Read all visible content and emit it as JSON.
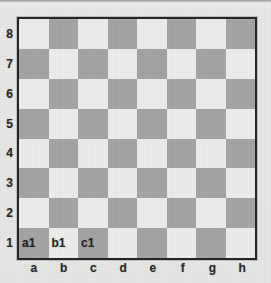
{
  "diagram": {
    "kind": "chessboard-coordinates",
    "orientation": "white-bottom"
  },
  "colors": {
    "light_square": "#ededeb",
    "dark_square": "#a3a3a3",
    "border": "#262626",
    "paper": "#e9e9e7",
    "text": "#2b2b2b"
  },
  "ranks": [
    "8",
    "7",
    "6",
    "5",
    "4",
    "3",
    "2",
    "1"
  ],
  "files": [
    "a",
    "b",
    "c",
    "d",
    "e",
    "f",
    "g",
    "h"
  ],
  "square_labels": {
    "a1": "a1",
    "b1": "b1",
    "c1": "c1"
  },
  "board": {
    "rows": [
      {
        "rank": "8",
        "squares": [
          {
            "id": "a8",
            "shade": "light",
            "label": ""
          },
          {
            "id": "b8",
            "shade": "dark",
            "label": ""
          },
          {
            "id": "c8",
            "shade": "light",
            "label": ""
          },
          {
            "id": "d8",
            "shade": "dark",
            "label": ""
          },
          {
            "id": "e8",
            "shade": "light",
            "label": ""
          },
          {
            "id": "f8",
            "shade": "dark",
            "label": ""
          },
          {
            "id": "g8",
            "shade": "light",
            "label": ""
          },
          {
            "id": "h8",
            "shade": "dark",
            "label": ""
          }
        ]
      },
      {
        "rank": "7",
        "squares": [
          {
            "id": "a7",
            "shade": "dark",
            "label": ""
          },
          {
            "id": "b7",
            "shade": "light",
            "label": ""
          },
          {
            "id": "c7",
            "shade": "dark",
            "label": ""
          },
          {
            "id": "d7",
            "shade": "light",
            "label": ""
          },
          {
            "id": "e7",
            "shade": "dark",
            "label": ""
          },
          {
            "id": "f7",
            "shade": "light",
            "label": ""
          },
          {
            "id": "g7",
            "shade": "dark",
            "label": ""
          },
          {
            "id": "h7",
            "shade": "light",
            "label": ""
          }
        ]
      },
      {
        "rank": "6",
        "squares": [
          {
            "id": "a6",
            "shade": "light",
            "label": ""
          },
          {
            "id": "b6",
            "shade": "dark",
            "label": ""
          },
          {
            "id": "c6",
            "shade": "light",
            "label": ""
          },
          {
            "id": "d6",
            "shade": "dark",
            "label": ""
          },
          {
            "id": "e6",
            "shade": "light",
            "label": ""
          },
          {
            "id": "f6",
            "shade": "dark",
            "label": ""
          },
          {
            "id": "g6",
            "shade": "light",
            "label": ""
          },
          {
            "id": "h6",
            "shade": "dark",
            "label": ""
          }
        ]
      },
      {
        "rank": "5",
        "squares": [
          {
            "id": "a5",
            "shade": "dark",
            "label": ""
          },
          {
            "id": "b5",
            "shade": "light",
            "label": ""
          },
          {
            "id": "c5",
            "shade": "dark",
            "label": ""
          },
          {
            "id": "d5",
            "shade": "light",
            "label": ""
          },
          {
            "id": "e5",
            "shade": "dark",
            "label": ""
          },
          {
            "id": "f5",
            "shade": "light",
            "label": ""
          },
          {
            "id": "g5",
            "shade": "dark",
            "label": ""
          },
          {
            "id": "h5",
            "shade": "light",
            "label": ""
          }
        ]
      },
      {
        "rank": "4",
        "squares": [
          {
            "id": "a4",
            "shade": "light",
            "label": ""
          },
          {
            "id": "b4",
            "shade": "dark",
            "label": ""
          },
          {
            "id": "c4",
            "shade": "light",
            "label": ""
          },
          {
            "id": "d4",
            "shade": "dark",
            "label": ""
          },
          {
            "id": "e4",
            "shade": "light",
            "label": ""
          },
          {
            "id": "f4",
            "shade": "dark",
            "label": ""
          },
          {
            "id": "g4",
            "shade": "light",
            "label": ""
          },
          {
            "id": "h4",
            "shade": "dark",
            "label": ""
          }
        ]
      },
      {
        "rank": "3",
        "squares": [
          {
            "id": "a3",
            "shade": "dark",
            "label": ""
          },
          {
            "id": "b3",
            "shade": "light",
            "label": ""
          },
          {
            "id": "c3",
            "shade": "dark",
            "label": ""
          },
          {
            "id": "d3",
            "shade": "light",
            "label": ""
          },
          {
            "id": "e3",
            "shade": "dark",
            "label": ""
          },
          {
            "id": "f3",
            "shade": "light",
            "label": ""
          },
          {
            "id": "g3",
            "shade": "dark",
            "label": ""
          },
          {
            "id": "h3",
            "shade": "light",
            "label": ""
          }
        ]
      },
      {
        "rank": "2",
        "squares": [
          {
            "id": "a2",
            "shade": "light",
            "label": ""
          },
          {
            "id": "b2",
            "shade": "dark",
            "label": ""
          },
          {
            "id": "c2",
            "shade": "light",
            "label": ""
          },
          {
            "id": "d2",
            "shade": "dark",
            "label": ""
          },
          {
            "id": "e2",
            "shade": "light",
            "label": ""
          },
          {
            "id": "f2",
            "shade": "dark",
            "label": ""
          },
          {
            "id": "g2",
            "shade": "light",
            "label": ""
          },
          {
            "id": "h2",
            "shade": "dark",
            "label": ""
          }
        ]
      },
      {
        "rank": "1",
        "squares": [
          {
            "id": "a1",
            "shade": "dark",
            "label": "a1"
          },
          {
            "id": "b1",
            "shade": "light",
            "label": "b1"
          },
          {
            "id": "c1",
            "shade": "dark",
            "label": "c1"
          },
          {
            "id": "d1",
            "shade": "light",
            "label": ""
          },
          {
            "id": "e1",
            "shade": "dark",
            "label": ""
          },
          {
            "id": "f1",
            "shade": "light",
            "label": ""
          },
          {
            "id": "g1",
            "shade": "dark",
            "label": ""
          },
          {
            "id": "h1",
            "shade": "light",
            "label": ""
          }
        ]
      }
    ]
  }
}
